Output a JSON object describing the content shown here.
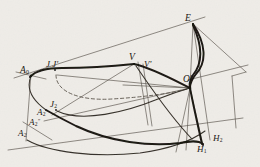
{
  "figure": {
    "kind": "geometric-construction-diagram",
    "medium": "ink-on-aged-paper",
    "background_color": "#f3f2ef",
    "ink_color": "#1b1712",
    "thin_line_color": "#4a443c",
    "dashed_line_color": "#5a544b",
    "width": 260,
    "height": 167
  },
  "labels": [
    {
      "id": "A0",
      "base": "A",
      "sub": "0",
      "sup": "",
      "x": 20,
      "y": 66,
      "size": "big"
    },
    {
      "id": "JJp",
      "base": "J J'",
      "sub": "",
      "sup": "",
      "x": 46,
      "y": 60,
      "size": "med"
    },
    {
      "id": "A2",
      "base": "A",
      "sub": "2",
      "sup": "",
      "x": 37,
      "y": 108,
      "size": "med"
    },
    {
      "id": "J2",
      "base": "J",
      "sub": "2",
      "sup": "",
      "x": 50,
      "y": 100,
      "size": "med"
    },
    {
      "id": "A2pp",
      "base": "A",
      "sub": "2",
      "sup": "″",
      "x": 29,
      "y": 118,
      "size": "med"
    },
    {
      "id": "A2b",
      "base": "A",
      "sub": "2",
      "sup": "",
      "x": 18,
      "y": 129,
      "size": "med"
    },
    {
      "id": "V",
      "base": "V",
      "sub": "",
      "sup": "",
      "x": 129,
      "y": 53,
      "size": "big"
    },
    {
      "id": "Vp",
      "base": "V'",
      "sub": "",
      "sup": "",
      "x": 144,
      "y": 60,
      "size": "med"
    },
    {
      "id": "E",
      "base": "E",
      "sub": "",
      "sup": "",
      "x": 185,
      "y": 14,
      "size": "big"
    },
    {
      "id": "Op",
      "base": "O'",
      "sub": "",
      "sup": "",
      "x": 183,
      "y": 75,
      "size": "big"
    },
    {
      "id": "H2",
      "base": "H",
      "sub": "2",
      "sup": "",
      "x": 213,
      "y": 134,
      "size": "med"
    },
    {
      "id": "H1",
      "base": "H",
      "sub": "1",
      "sup": "",
      "x": 197,
      "y": 145,
      "size": "med"
    }
  ],
  "points": {
    "A0": [
      31,
      76
    ],
    "J": [
      54,
      72
    ],
    "V": [
      134,
      64
    ],
    "E": [
      193,
      24
    ],
    "Op": [
      190,
      88
    ],
    "A2": [
      48,
      117
    ],
    "J2": [
      57,
      111
    ],
    "A2pp": [
      38,
      127
    ],
    "A2b": [
      28,
      137
    ],
    "H1": [
      203,
      145
    ],
    "H2": [
      210,
      140
    ],
    "Vp": [
      141,
      66
    ]
  },
  "strokes": {
    "thick": 2.0,
    "medium": 1.15,
    "thin": 0.65,
    "dash_pattern": "3.2 2.6"
  }
}
